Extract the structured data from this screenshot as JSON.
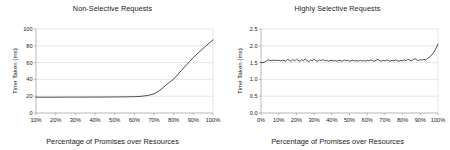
{
  "figure": {
    "background": "#ffffff",
    "line_color": "#3a3a3a",
    "grid_color": "#cccccc",
    "axis_color": "#999999"
  },
  "chart_data": [
    {
      "type": "line",
      "title": "Non-Selective Requests",
      "xlabel": "Percentage of Promises over Resources",
      "ylabel": "Time Taken (ms)",
      "grid": true,
      "legend": "none",
      "xlim": [
        10,
        100
      ],
      "ylim": [
        0,
        100
      ],
      "xticks": [
        10,
        20,
        30,
        40,
        50,
        60,
        70,
        80,
        90,
        100
      ],
      "xticklabels": [
        "10%",
        "20%",
        "30%",
        "40%",
        "50%",
        "60%",
        "70%",
        "80%",
        "90%",
        "100%"
      ],
      "yticks": [
        0,
        20,
        40,
        60,
        80,
        100
      ],
      "yticklabels": [
        "0",
        "20",
        "40",
        "60",
        "80",
        "100"
      ],
      "x": [
        10,
        15,
        20,
        25,
        30,
        35,
        40,
        45,
        50,
        55,
        60,
        62,
        64,
        66,
        68,
        70,
        72,
        74,
        76,
        78,
        80,
        82,
        84,
        86,
        88,
        90,
        92,
        94,
        96,
        98,
        100
      ],
      "y": [
        18.8,
        18.8,
        18.8,
        18.9,
        18.9,
        18.9,
        19.0,
        19.0,
        19.1,
        19.2,
        19.4,
        19.6,
        20.0,
        20.6,
        21.5,
        22.8,
        25.5,
        29.0,
        33.0,
        36.8,
        40.4,
        45.5,
        50.8,
        56.0,
        61.0,
        66.0,
        70.5,
        74.8,
        79.0,
        83.2,
        87.0
      ]
    },
    {
      "type": "line",
      "title": "Highly Selective Requests",
      "xlabel": "Percentage of Promises over Resources",
      "ylabel": "Time Taken (ms)",
      "grid": true,
      "legend": "none",
      "xlim": [
        0,
        100
      ],
      "ylim": [
        0.0,
        2.5
      ],
      "xticks": [
        0,
        10,
        20,
        30,
        40,
        50,
        60,
        70,
        80,
        90,
        100
      ],
      "xticklabels": [
        "0%",
        "10%",
        "20%",
        "30%",
        "40%",
        "50%",
        "60%",
        "70%",
        "80%",
        "90%",
        "100%"
      ],
      "yticks": [
        0.0,
        0.5,
        1.0,
        1.5,
        2.0,
        2.5
      ],
      "yticklabels": [
        "0.0",
        "0.5",
        "1.0",
        "1.5",
        "2.0",
        "2.5"
      ],
      "x": [
        0,
        1,
        2,
        3,
        4,
        5,
        6,
        7,
        8,
        9,
        10,
        11,
        12,
        13,
        14,
        15,
        16,
        17,
        18,
        19,
        20,
        21,
        22,
        23,
        24,
        25,
        26,
        27,
        28,
        29,
        30,
        31,
        32,
        33,
        34,
        35,
        36,
        37,
        38,
        39,
        40,
        41,
        42,
        43,
        44,
        45,
        46,
        47,
        48,
        49,
        50,
        51,
        52,
        53,
        54,
        55,
        56,
        57,
        58,
        59,
        60,
        61,
        62,
        63,
        64,
        65,
        66,
        67,
        68,
        69,
        70,
        71,
        72,
        73,
        74,
        75,
        76,
        77,
        78,
        79,
        80,
        81,
        82,
        83,
        84,
        85,
        86,
        87,
        88,
        89,
        90,
        91,
        92,
        93,
        94,
        95,
        96,
        97,
        98,
        99,
        100
      ],
      "y": [
        1.5,
        1.5,
        1.51,
        1.55,
        1.58,
        1.57,
        1.56,
        1.57,
        1.57,
        1.56,
        1.57,
        1.55,
        1.57,
        1.56,
        1.54,
        1.6,
        1.57,
        1.54,
        1.59,
        1.55,
        1.6,
        1.56,
        1.54,
        1.59,
        1.55,
        1.61,
        1.56,
        1.53,
        1.58,
        1.55,
        1.6,
        1.56,
        1.54,
        1.58,
        1.56,
        1.59,
        1.55,
        1.57,
        1.54,
        1.56,
        1.57,
        1.55,
        1.56,
        1.54,
        1.57,
        1.56,
        1.54,
        1.58,
        1.55,
        1.57,
        1.54,
        1.56,
        1.57,
        1.55,
        1.56,
        1.54,
        1.57,
        1.55,
        1.56,
        1.54,
        1.57,
        1.55,
        1.58,
        1.56,
        1.54,
        1.57,
        1.6,
        1.56,
        1.54,
        1.57,
        1.55,
        1.58,
        1.56,
        1.54,
        1.57,
        1.55,
        1.58,
        1.56,
        1.54,
        1.57,
        1.55,
        1.58,
        1.56,
        1.6,
        1.57,
        1.55,
        1.59,
        1.62,
        1.58,
        1.56,
        1.59,
        1.57,
        1.6,
        1.58,
        1.62,
        1.66,
        1.7,
        1.76,
        1.84,
        1.94,
        2.05
      ]
    }
  ]
}
